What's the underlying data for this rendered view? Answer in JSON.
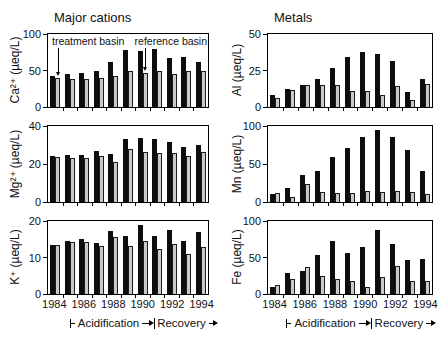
{
  "figure": {
    "left_title": "Major cations",
    "right_title": "Metals",
    "treatment_label": "treatment basin",
    "reference_label": "reference basin",
    "phase": {
      "acidification": "Acidification",
      "recovery": "Recovery"
    }
  },
  "colors": {
    "treatment_bar": "#0d0d0d",
    "reference_bar_fill": "#c9c9c9",
    "reference_bar_border": "#1c1c1c",
    "axis": "#000000",
    "background": "#ffffff"
  },
  "chart_data": [
    {
      "id": "ca",
      "type": "bar",
      "ylabel": "Ca²⁺ (µeq/L)",
      "ylim": [
        0,
        100
      ],
      "yticks": [
        0,
        50,
        100
      ],
      "categories": [
        1984,
        1985,
        1986,
        1987,
        1988,
        1989,
        1990,
        1991,
        1992,
        1993,
        1994
      ],
      "xtick_labels": [
        "1984",
        "",
        "1986",
        "",
        "1988",
        "",
        "1990",
        "",
        "1992",
        "",
        "1994"
      ],
      "show_x_labels": false,
      "series": [
        {
          "name": "treatment basin",
          "values": [
            42,
            45,
            46,
            50,
            61,
            78,
            77,
            80,
            67,
            69,
            62
          ]
        },
        {
          "name": "reference basin",
          "values": [
            40,
            39,
            39,
            40,
            42,
            49,
            47,
            50,
            45,
            50,
            50
          ]
        }
      ]
    },
    {
      "id": "al",
      "type": "bar",
      "ylabel": "Al (µeq/L)",
      "ylim": [
        0,
        50
      ],
      "yticks": [
        0,
        25,
        50
      ],
      "categories": [
        1984,
        1985,
        1986,
        1987,
        1988,
        1989,
        1990,
        1991,
        1992,
        1993,
        1994
      ],
      "xtick_labels": [
        "1984",
        "",
        "1986",
        "",
        "1988",
        "",
        "1990",
        "",
        "1992",
        "",
        "1994"
      ],
      "show_x_labels": false,
      "series": [
        {
          "name": "treatment basin",
          "values": [
            8,
            12,
            15,
            19,
            26.5,
            34.5,
            38,
            36.5,
            31.5,
            10,
            19
          ]
        },
        {
          "name": "reference basin",
          "values": [
            6,
            11.5,
            15,
            15,
            15,
            11,
            11,
            8.5,
            14.5,
            5,
            16
          ]
        }
      ]
    },
    {
      "id": "mg",
      "type": "bar",
      "ylabel": "Mg²⁺ (µeq/L)",
      "ylim": [
        0,
        40
      ],
      "yticks": [
        0,
        20,
        40
      ],
      "categories": [
        1984,
        1985,
        1986,
        1987,
        1988,
        1989,
        1990,
        1991,
        1992,
        1993,
        1994
      ],
      "xtick_labels": [
        "1984",
        "",
        "1986",
        "",
        "1988",
        "",
        "1990",
        "",
        "1992",
        "",
        "1994"
      ],
      "show_x_labels": false,
      "series": [
        {
          "name": "treatment basin",
          "values": [
            24,
            25,
            24.5,
            27,
            25.5,
            33,
            33.5,
            33,
            31.5,
            29,
            30
          ]
        },
        {
          "name": "reference basin",
          "values": [
            23.5,
            23,
            23,
            24,
            21,
            28,
            26.5,
            26,
            26,
            24,
            26.5
          ]
        }
      ]
    },
    {
      "id": "mn",
      "type": "bar",
      "ylabel": "Mn (µeq/L)",
      "ylim": [
        0,
        100
      ],
      "yticks": [
        0,
        50,
        100
      ],
      "categories": [
        1984,
        1985,
        1986,
        1987,
        1988,
        1989,
        1990,
        1991,
        1992,
        1993,
        1994
      ],
      "xtick_labels": [
        "1984",
        "",
        "1986",
        "",
        "1988",
        "",
        "1990",
        "",
        "1992",
        "",
        "1994"
      ],
      "show_x_labels": false,
      "series": [
        {
          "name": "treatment basin",
          "values": [
            11,
            18,
            35,
            41,
            59,
            71,
            86,
            95,
            85,
            69,
            41
          ]
        },
        {
          "name": "reference basin",
          "values": [
            12,
            7,
            24,
            13,
            12,
            12,
            14,
            13,
            14,
            13,
            11
          ]
        }
      ]
    },
    {
      "id": "k",
      "type": "bar",
      "ylabel": "K⁺ (µeq/L)",
      "ylim": [
        0,
        20
      ],
      "yticks": [
        0,
        10,
        20
      ],
      "categories": [
        1984,
        1985,
        1986,
        1987,
        1988,
        1989,
        1990,
        1991,
        1992,
        1993,
        1994
      ],
      "xtick_labels": [
        "1984",
        "",
        "1986",
        "",
        "1988",
        "",
        "1990",
        "",
        "1992",
        "",
        "1994"
      ],
      "show_x_labels": true,
      "series": [
        {
          "name": "treatment basin",
          "values": [
            13.5,
            14.5,
            15.2,
            14,
            17.2,
            15.8,
            19,
            15.8,
            17.5,
            14.6,
            17
          ]
        },
        {
          "name": "reference basin",
          "values": [
            13.5,
            14.3,
            14.2,
            13.2,
            15.6,
            13.2,
            14.5,
            12.2,
            13.6,
            11,
            12.8
          ]
        }
      ]
    },
    {
      "id": "fe",
      "type": "bar",
      "ylabel": "Fe (µeq/L)",
      "ylim": [
        0,
        100
      ],
      "yticks": [
        0,
        50,
        100
      ],
      "categories": [
        1984,
        1985,
        1986,
        1987,
        1988,
        1989,
        1990,
        1991,
        1992,
        1993,
        1994
      ],
      "xtick_labels": [
        "1984",
        "",
        "1986",
        "",
        "1988",
        "",
        "1990",
        "",
        "1992",
        "",
        "1994"
      ],
      "show_x_labels": true,
      "series": [
        {
          "name": "treatment basin",
          "values": [
            10,
            29,
            32,
            54,
            73,
            56,
            65,
            88,
            68,
            47,
            48
          ]
        },
        {
          "name": "reference basin",
          "values": [
            12,
            21,
            37,
            24,
            21,
            18,
            10,
            23,
            38,
            18,
            18
          ]
        }
      ]
    }
  ]
}
